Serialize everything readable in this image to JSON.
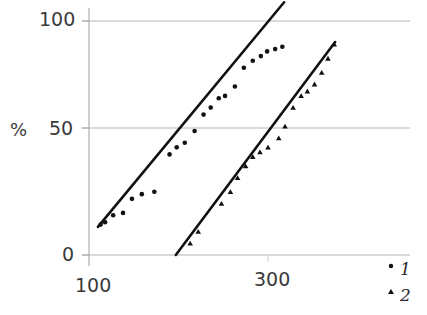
{
  "chart_data": {
    "type": "scatter",
    "title": "",
    "xlabel": "",
    "ylabel": "%",
    "xlim": [
      55,
      430
    ],
    "ylim": [
      0,
      108
    ],
    "grid": true,
    "xticks": [
      100,
      300
    ],
    "xticklabels": [
      "100",
      "300"
    ],
    "yticks": [
      0,
      50,
      100
    ],
    "yticklabels": [
      "0",
      "50",
      "100"
    ],
    "legend_position": "bottom-right",
    "series": [
      {
        "name": "1",
        "marker": "circle",
        "fit_line": {
          "x": [
            110,
            318
          ],
          "y": [
            12,
            108
          ]
        },
        "points": [
          {
            "x": 113,
            "y": 13
          },
          {
            "x": 118,
            "y": 14
          },
          {
            "x": 127,
            "y": 17
          },
          {
            "x": 138,
            "y": 18
          },
          {
            "x": 148,
            "y": 24
          },
          {
            "x": 159,
            "y": 26
          },
          {
            "x": 173,
            "y": 27
          },
          {
            "x": 190,
            "y": 43
          },
          {
            "x": 198,
            "y": 46
          },
          {
            "x": 207,
            "y": 48
          },
          {
            "x": 218,
            "y": 53
          },
          {
            "x": 228,
            "y": 60
          },
          {
            "x": 236,
            "y": 63
          },
          {
            "x": 245,
            "y": 67
          },
          {
            "x": 252,
            "y": 68
          },
          {
            "x": 263,
            "y": 72
          },
          {
            "x": 273,
            "y": 80
          },
          {
            "x": 283,
            "y": 83
          },
          {
            "x": 292,
            "y": 85
          },
          {
            "x": 299,
            "y": 87
          },
          {
            "x": 308,
            "y": 88
          },
          {
            "x": 316,
            "y": 89
          }
        ]
      },
      {
        "name": "2",
        "marker": "triangle",
        "fit_line": {
          "x": [
            197,
            375
          ],
          "y": [
            0,
            91
          ]
        },
        "points": [
          {
            "x": 213,
            "y": 5
          },
          {
            "x": 222,
            "y": 10
          },
          {
            "x": 248,
            "y": 22
          },
          {
            "x": 258,
            "y": 27
          },
          {
            "x": 266,
            "y": 33
          },
          {
            "x": 275,
            "y": 38
          },
          {
            "x": 283,
            "y": 42
          },
          {
            "x": 291,
            "y": 44
          },
          {
            "x": 300,
            "y": 46
          },
          {
            "x": 312,
            "y": 50
          },
          {
            "x": 319,
            "y": 55
          },
          {
            "x": 328,
            "y": 63
          },
          {
            "x": 337,
            "y": 68
          },
          {
            "x": 344,
            "y": 70
          },
          {
            "x": 352,
            "y": 73
          },
          {
            "x": 360,
            "y": 78
          },
          {
            "x": 367,
            "y": 84
          },
          {
            "x": 374,
            "y": 90
          }
        ]
      }
    ]
  },
  "legend": {
    "items": [
      {
        "label": "1",
        "marker": "circle"
      },
      {
        "label": "2",
        "marker": "triangle"
      }
    ]
  }
}
